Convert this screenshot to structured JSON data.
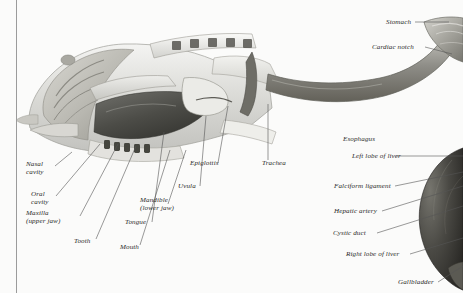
{
  "figure": {
    "style": "grayscale anatomical illustration with leader-line callouts",
    "background_color": "#fbfbfa",
    "label_color": "#2b2b2b",
    "leader_color": "#555555",
    "page_rule_color": "#9b9b9b"
  },
  "labels": {
    "nasal_cavity": "Nasal\ncavity",
    "oral_cavity": "Oral\ncavity",
    "maxilla": "Maxilla\n(upper jaw)",
    "tooth": "Tooth",
    "mouth": "Mouth",
    "tongue": "Tongue",
    "mandible": "Mandible\n(lower jaw)",
    "uvula": "Uvula",
    "epiglottis": "Epiglottis",
    "trachea": "Trachea",
    "stomach": "Stomach",
    "cardiac_notch": "Cardiac notch",
    "esophagus": "Esophagus",
    "left_lobe_of_liver": "Left lobe of liver",
    "falciform_ligament": "Falciform ligament",
    "hepatic_artery": "Hepatic artery",
    "cystic_duct": "Cystic duct",
    "right_lobe_of_liver": "Right lobe of liver",
    "gallbladder": "Gallbladder"
  }
}
